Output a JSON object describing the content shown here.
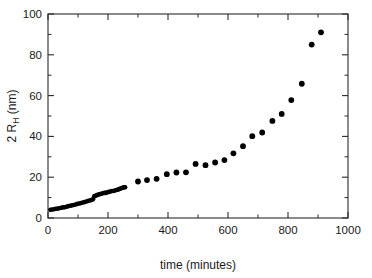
{
  "chart_data": {
    "type": "scatter",
    "title": "",
    "xlabel": "time (minutes)",
    "ylabel_full": "2 R_H (nm)",
    "ylabel_prefix": "2 R",
    "ylabel_subscript": "H",
    "ylabel_suffix": " (nm)",
    "xlim": [
      0,
      1000
    ],
    "ylim": [
      0,
      100
    ],
    "xticks": [
      0,
      200,
      400,
      600,
      800,
      1000
    ],
    "xtick_labels": [
      "0",
      "200",
      "400",
      "600",
      "800",
      "1000"
    ],
    "yticks": [
      0,
      20,
      40,
      60,
      80,
      100
    ],
    "ytick_labels": [
      "0",
      "20",
      "40",
      "60",
      "80",
      "100"
    ],
    "x_minor_step": 100,
    "y_minor_step": 10,
    "grid": false,
    "legend": null,
    "marker": "filled-circle",
    "marker_color": "#000000",
    "marker_size_dense": 2.3,
    "marker_size_sparse": 2.9,
    "frame": true,
    "tick_direction": "in",
    "series": [
      {
        "name": "dense-early-sampling",
        "marker_size": 2.3,
        "points": [
          [
            8,
            4.0
          ],
          [
            14,
            4.2
          ],
          [
            20,
            4.3
          ],
          [
            26,
            4.5
          ],
          [
            32,
            4.6
          ],
          [
            38,
            4.8
          ],
          [
            44,
            5.0
          ],
          [
            50,
            5.2
          ],
          [
            56,
            5.3
          ],
          [
            62,
            5.5
          ],
          [
            68,
            5.8
          ],
          [
            74,
            6.0
          ],
          [
            80,
            6.2
          ],
          [
            86,
            6.4
          ],
          [
            92,
            6.6
          ],
          [
            98,
            6.9
          ],
          [
            104,
            7.1
          ],
          [
            110,
            7.3
          ],
          [
            116,
            7.6
          ],
          [
            122,
            7.8
          ],
          [
            128,
            8.1
          ],
          [
            134,
            8.4
          ],
          [
            140,
            8.6
          ],
          [
            146,
            8.9
          ],
          [
            150,
            9.2
          ],
          [
            154,
            10.6
          ],
          [
            158,
            10.9
          ],
          [
            163,
            11.2
          ],
          [
            168,
            11.5
          ],
          [
            173,
            11.7
          ],
          [
            178,
            11.9
          ],
          [
            183,
            12.1
          ],
          [
            188,
            12.3
          ],
          [
            193,
            12.3
          ],
          [
            198,
            12.6
          ],
          [
            203,
            12.8
          ],
          [
            208,
            13.0
          ],
          [
            213,
            13.2
          ],
          [
            218,
            13.2
          ],
          [
            223,
            13.5
          ],
          [
            228,
            13.7
          ],
          [
            233,
            13.9
          ],
          [
            238,
            14.2
          ],
          [
            243,
            14.5
          ],
          [
            248,
            14.8
          ],
          [
            253,
            15.0
          ],
          [
            257,
            15.1
          ]
        ]
      },
      {
        "name": "sparse-late-sampling",
        "marker_size": 2.9,
        "points": [
          [
            300,
            17.9
          ],
          [
            330,
            18.6
          ],
          [
            362,
            19.2
          ],
          [
            396,
            21.5
          ],
          [
            428,
            22.3
          ],
          [
            460,
            22.4
          ],
          [
            492,
            26.5
          ],
          [
            525,
            25.9
          ],
          [
            557,
            27.2
          ],
          [
            588,
            28.4
          ],
          [
            618,
            31.7
          ],
          [
            650,
            35.2
          ],
          [
            681,
            40.1
          ],
          [
            714,
            41.9
          ],
          [
            748,
            47.6
          ],
          [
            779,
            51.0
          ],
          [
            811,
            57.8
          ],
          [
            846,
            65.8
          ],
          [
            879,
            85.0
          ],
          [
            910,
            91.0
          ]
        ]
      }
    ]
  },
  "figure": {
    "background_color": "#ffffff",
    "axis_color": "#2a2a2a",
    "text_color": "#1a1a1a"
  }
}
